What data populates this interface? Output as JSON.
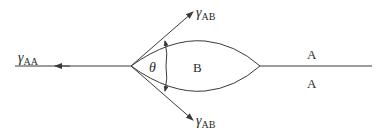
{
  "diagram": {
    "type": "triple-junction-lens",
    "labels": {
      "gamma_left": {
        "symbol": "γ",
        "sub": "AA"
      },
      "gamma_top": {
        "symbol": "γ",
        "sub": "AB"
      },
      "gamma_bottom": {
        "symbol": "γ",
        "sub": "AB"
      },
      "angle": "θ",
      "lens_phase": "B",
      "grain_top": "A",
      "grain_bottom": "A"
    },
    "colors": {
      "line": "#3a3a3a",
      "text": "#2a2a2a",
      "background": "#ffffff"
    }
  }
}
